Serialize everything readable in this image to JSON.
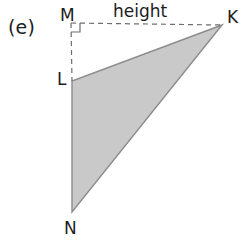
{
  "figure": {
    "part_label": "(e)",
    "height_label": "height",
    "canvas": {
      "width": 252,
      "height": 247,
      "background": "#ffffff"
    },
    "vertex_labels": {
      "M": "M",
      "K": "K",
      "L": "L",
      "N": "N"
    },
    "points": {
      "M": {
        "x": 71,
        "y": 23
      },
      "K": {
        "x": 222,
        "y": 25
      },
      "L": {
        "x": 72,
        "y": 81
      },
      "N": {
        "x": 72,
        "y": 212
      }
    },
    "triangle": {
      "name": "KLN",
      "vertices": [
        "K",
        "L",
        "N"
      ],
      "fill_color": "#c9c9c9",
      "stroke_color": "#8c8c8c",
      "stroke_width": 1.4
    },
    "dashed_lines": [
      {
        "name": "height-horizontal-MK",
        "from": "M",
        "to": "K",
        "color": "#6e6e6e",
        "dash": "5,4"
      },
      {
        "name": "height-vertical-ML",
        "from": "M",
        "to": "L",
        "color": "#6e6e6e",
        "dash": "5,4"
      }
    ],
    "right_angle_marker": {
      "at": "M",
      "size": 9,
      "color": "#6e6e6e"
    }
  }
}
